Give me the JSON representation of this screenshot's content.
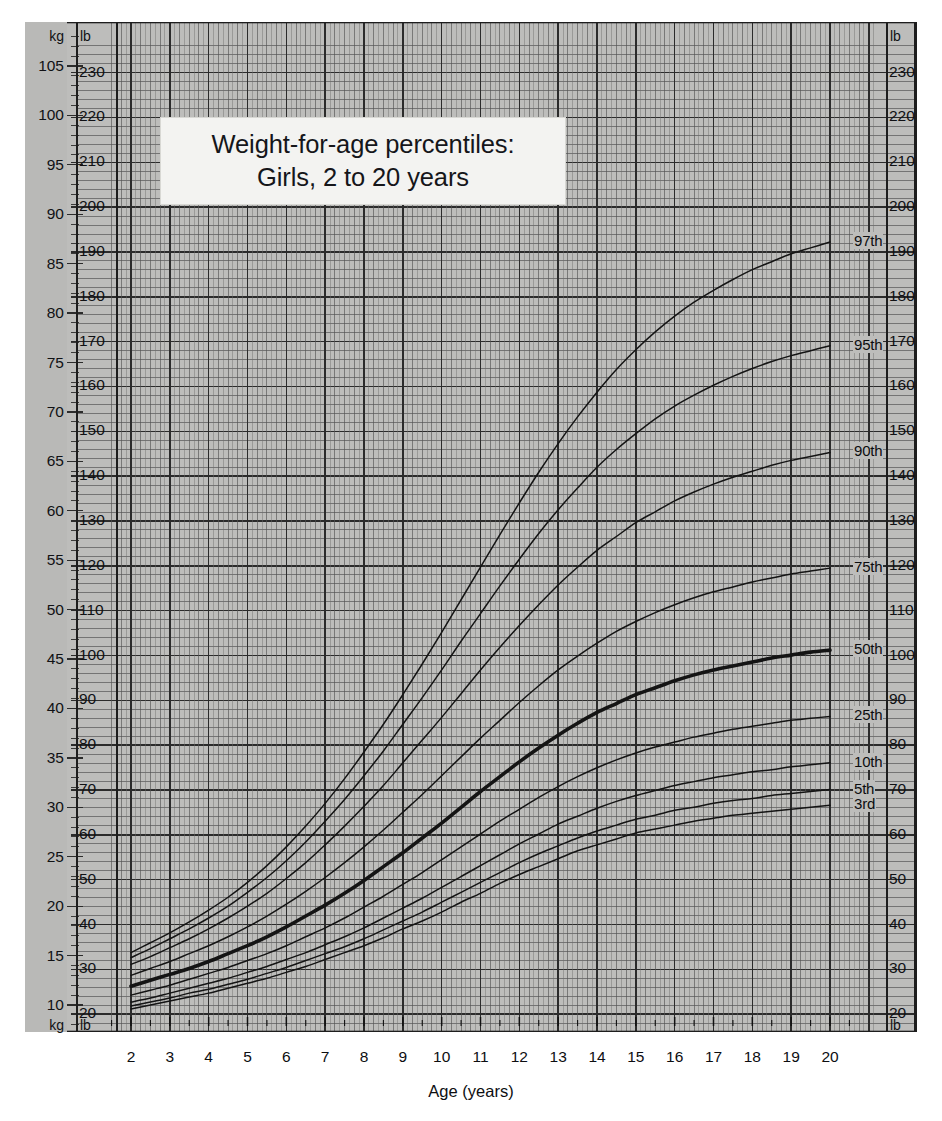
{
  "title": {
    "line1": "Weight-for-age percentiles:",
    "line2": "Girls, 2 to 20 years"
  },
  "axes": {
    "x_title": "Age (years)",
    "x_ticks": [
      2,
      3,
      4,
      5,
      6,
      7,
      8,
      9,
      10,
      11,
      12,
      13,
      14,
      15,
      16,
      17,
      18,
      19,
      20
    ],
    "x_range": [
      1.5,
      20.9
    ],
    "left_unit_top": "kg",
    "left_unit_bottom": "kg",
    "lb_unit_top": "lb",
    "lb_unit_bottom": "lb",
    "right_unit_top": "lb",
    "right_unit_bottom": "lb",
    "kg_ticks": [
      10,
      15,
      20,
      25,
      30,
      35,
      40,
      45,
      50,
      55,
      60,
      65,
      70,
      75,
      80,
      85,
      90,
      95,
      100,
      105
    ],
    "lb_ticks": [
      20,
      30,
      40,
      50,
      60,
      70,
      80,
      90,
      100,
      110,
      120,
      130,
      140,
      150,
      160,
      170,
      180,
      190,
      200,
      210,
      220,
      230
    ],
    "y_range_kg": [
      7.5,
      109.0
    ]
  },
  "colors": {
    "grid_background": "#bdbdbb",
    "grid_line": "#2b2b2b",
    "grid_minor": "#555555",
    "curve": "#141414",
    "title_card": "#f3f3f1",
    "axis_strip": "#b9b9b7"
  },
  "chart_data": {
    "type": "line",
    "title": "Weight-for-age percentiles: Girls, 2 to 20 years",
    "xlabel": "Age (years)",
    "ylabel": "Weight (kg / lb)",
    "xlim": [
      1.5,
      20.9
    ],
    "ylim_kg": [
      7.5,
      109.0
    ],
    "grid": true,
    "legend": "inline-right-end-labels",
    "x": [
      2,
      2.5,
      3,
      3.5,
      4,
      4.5,
      5,
      5.5,
      6,
      6.5,
      7,
      7.5,
      8,
      8.5,
      9,
      9.5,
      10,
      10.5,
      11,
      11.5,
      12,
      12.5,
      13,
      13.5,
      14,
      14.5,
      15,
      15.5,
      16,
      16.5,
      17,
      17.5,
      18,
      18.5,
      19,
      19.5,
      20
    ],
    "series": [
      {
        "name": "97th",
        "label": "97th",
        "values_kg": [
          15.3,
          16.3,
          17.3,
          18.4,
          19.6,
          20.9,
          22.4,
          24.1,
          26.0,
          28.1,
          30.4,
          32.9,
          35.6,
          38.4,
          41.4,
          44.5,
          47.7,
          51.0,
          54.3,
          57.6,
          60.8,
          63.9,
          66.8,
          69.5,
          72.0,
          74.3,
          76.3,
          78.1,
          79.7,
          81.1,
          82.3,
          83.4,
          84.4,
          85.2,
          86.0,
          86.6,
          87.2
        ]
      },
      {
        "name": "95th",
        "label": "95th",
        "values_kg": [
          14.8,
          15.7,
          16.7,
          17.7,
          18.8,
          20.0,
          21.4,
          22.9,
          24.6,
          26.5,
          28.6,
          30.8,
          33.2,
          35.7,
          38.4,
          41.1,
          43.9,
          46.8,
          49.6,
          52.4,
          55.1,
          57.7,
          60.1,
          62.3,
          64.4,
          66.2,
          67.8,
          69.3,
          70.6,
          71.7,
          72.7,
          73.6,
          74.4,
          75.1,
          75.7,
          76.2,
          76.7
        ]
      },
      {
        "name": "90th",
        "label": "90th",
        "values_kg": [
          14.1,
          14.9,
          15.8,
          16.7,
          17.7,
          18.8,
          20.0,
          21.3,
          22.8,
          24.4,
          26.2,
          28.1,
          30.1,
          32.2,
          34.5,
          36.8,
          39.1,
          41.5,
          43.9,
          46.2,
          48.4,
          50.5,
          52.5,
          54.3,
          56.0,
          57.4,
          58.8,
          59.9,
          61.0,
          61.9,
          62.7,
          63.4,
          64.0,
          64.6,
          65.1,
          65.5,
          65.9
        ]
      },
      {
        "name": "75th",
        "label": "75th",
        "values_kg": [
          13.0,
          13.7,
          14.4,
          15.2,
          16.0,
          16.9,
          17.9,
          19.0,
          20.2,
          21.5,
          22.9,
          24.4,
          26.0,
          27.7,
          29.5,
          31.3,
          33.2,
          35.1,
          37.0,
          38.8,
          40.6,
          42.3,
          43.9,
          45.3,
          46.6,
          47.8,
          48.8,
          49.7,
          50.5,
          51.2,
          51.8,
          52.3,
          52.8,
          53.2,
          53.6,
          53.9,
          54.2
        ]
      },
      {
        "name": "50th",
        "label": "50th",
        "values_kg": [
          11.9,
          12.5,
          13.1,
          13.7,
          14.4,
          15.2,
          16.0,
          16.9,
          17.9,
          19.0,
          20.1,
          21.3,
          22.6,
          24.0,
          25.4,
          26.9,
          28.4,
          30.0,
          31.6,
          33.1,
          34.6,
          36.0,
          37.3,
          38.5,
          39.6,
          40.5,
          41.4,
          42.1,
          42.8,
          43.4,
          43.9,
          44.3,
          44.7,
          45.1,
          45.4,
          45.7,
          45.9
        ]
      },
      {
        "name": "25th",
        "label": "25th",
        "values_kg": [
          11.0,
          11.5,
          12.0,
          12.6,
          13.2,
          13.8,
          14.5,
          15.2,
          16.0,
          16.9,
          17.8,
          18.8,
          19.9,
          21.0,
          22.2,
          23.4,
          24.7,
          26.0,
          27.3,
          28.6,
          29.8,
          31.0,
          32.1,
          33.1,
          34.0,
          34.8,
          35.5,
          36.1,
          36.6,
          37.1,
          37.5,
          37.9,
          38.2,
          38.5,
          38.8,
          39.0,
          39.2
        ]
      },
      {
        "name": "10th",
        "label": "10th",
        "values_kg": [
          10.3,
          10.7,
          11.2,
          11.7,
          12.2,
          12.7,
          13.3,
          13.9,
          14.6,
          15.3,
          16.1,
          16.9,
          17.8,
          18.8,
          19.8,
          20.8,
          21.9,
          23.0,
          24.1,
          25.2,
          26.3,
          27.3,
          28.3,
          29.1,
          29.9,
          30.6,
          31.2,
          31.7,
          32.2,
          32.6,
          33.0,
          33.3,
          33.6,
          33.8,
          34.1,
          34.3,
          34.5
        ]
      },
      {
        "name": "5th",
        "label": "5th",
        "values_kg": [
          9.9,
          10.3,
          10.7,
          11.2,
          11.6,
          12.1,
          12.6,
          13.2,
          13.8,
          14.5,
          15.2,
          15.9,
          16.7,
          17.6,
          18.5,
          19.4,
          20.4,
          21.4,
          22.4,
          23.4,
          24.4,
          25.3,
          26.1,
          26.9,
          27.6,
          28.2,
          28.8,
          29.2,
          29.7,
          30.0,
          30.4,
          30.7,
          30.9,
          31.2,
          31.4,
          31.6,
          31.8
        ]
      },
      {
        "name": "3rd",
        "label": "3rd",
        "values_kg": [
          9.6,
          10.0,
          10.4,
          10.8,
          11.2,
          11.7,
          12.2,
          12.7,
          13.3,
          13.9,
          14.6,
          15.3,
          16.0,
          16.8,
          17.7,
          18.5,
          19.4,
          20.4,
          21.3,
          22.3,
          23.2,
          24.0,
          24.8,
          25.6,
          26.2,
          26.8,
          27.4,
          27.8,
          28.2,
          28.6,
          28.9,
          29.2,
          29.4,
          29.6,
          29.8,
          30.0,
          30.2
        ]
      }
    ]
  }
}
